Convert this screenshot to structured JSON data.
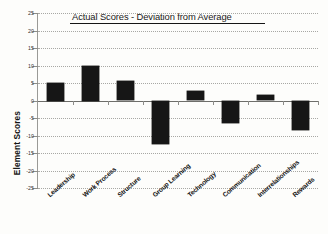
{
  "chart_data": {
    "type": "bar",
    "title": "Actual Scores - Deviation from Average",
    "xlabel": "",
    "ylabel": "Element Scores",
    "categories": [
      "Leadership",
      "Work Process",
      "Structure",
      "Group Learning",
      "Technology",
      "Communication",
      "Interrelationships",
      "Rewards"
    ],
    "values": [
      5.0,
      10.0,
      5.7,
      -12.5,
      2.7,
      -6.5,
      1.7,
      -8.5
    ],
    "ylim": [
      -25,
      25
    ],
    "ytick_values": [
      25,
      20,
      15,
      10,
      5,
      0,
      -5,
      -10,
      -15,
      -20,
      -25
    ],
    "ytick_labels": [
      "25",
      "20",
      "15",
      "10",
      "5",
      "0",
      "-5",
      "-10",
      "-15",
      "-20",
      "-25"
    ],
    "grid": true,
    "grid_style": "dotted-horizontal",
    "legend": false,
    "legend_position": "none",
    "bar_color": "#161616",
    "grid_color": "#a8a8a4",
    "axis_color": "#8d8d89",
    "title_underlined": true,
    "annotations": []
  }
}
